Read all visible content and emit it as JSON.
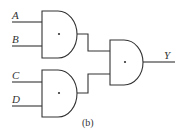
{
  "diagram": {
    "type": "logic-circuit",
    "caption": "(b)",
    "inputs": [
      "A",
      "B",
      "C",
      "D"
    ],
    "output": "Y",
    "gates": [
      {
        "id": "gate-1",
        "kind": "AND",
        "symbol": "•",
        "inputs": [
          "A",
          "B"
        ]
      },
      {
        "id": "gate-2",
        "kind": "AND",
        "symbol": "•",
        "inputs": [
          "C",
          "D"
        ]
      },
      {
        "id": "gate-3",
        "kind": "AND",
        "symbol": "•",
        "inputs": [
          "gate-1",
          "gate-2"
        ],
        "output": "Y"
      }
    ]
  }
}
